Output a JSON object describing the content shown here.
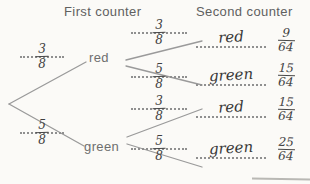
{
  "headers": {
    "first": "First counter",
    "second": "Second counter"
  },
  "tree": {
    "level1": [
      {
        "label": "red",
        "probability": {
          "numerator": "3",
          "denominator": "8"
        }
      },
      {
        "label": "green",
        "probability": {
          "numerator": "5",
          "denominator": "8"
        }
      }
    ],
    "level2": [
      {
        "from": "red",
        "outcome": "red",
        "probability": {
          "numerator": "3",
          "denominator": "8"
        },
        "result": {
          "numerator": "9",
          "denominator": "64"
        }
      },
      {
        "from": "red",
        "outcome": "green",
        "probability": {
          "numerator": "5",
          "denominator": "8"
        },
        "result": {
          "numerator": "15",
          "denominator": "64"
        }
      },
      {
        "from": "green",
        "outcome": "red",
        "probability": {
          "numerator": "3",
          "denominator": "8"
        },
        "result": {
          "numerator": "15",
          "denominator": "64"
        }
      },
      {
        "from": "green",
        "outcome": "green",
        "probability": {
          "numerator": "5",
          "denominator": "8"
        },
        "result": {
          "numerator": "25",
          "denominator": "64"
        }
      }
    ]
  },
  "colors": {
    "paper": "#fbfaf7",
    "printed_text": "#6e6e6e",
    "handwriting": "#3f3f3f",
    "branch_line": "#9a9a9a",
    "dotted_line": "#8f8f8f"
  }
}
